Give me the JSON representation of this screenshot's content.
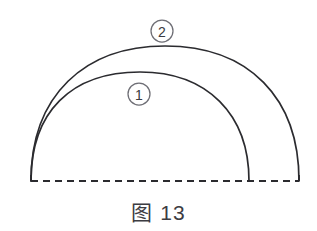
{
  "figure": {
    "caption_label": "图",
    "caption_number": "13",
    "background_color": "#ffffff",
    "stroke_color": "#2b2b2f",
    "label_outline_color": "#6e6e75"
  },
  "geometry": {
    "baseline": {
      "y": 181,
      "x_start": 31,
      "x_end": 299,
      "style": "dashed"
    },
    "arcs": [
      {
        "id": "arc-inner",
        "label": "①",
        "start_x": 31,
        "start_y": 181,
        "end_x": 249,
        "end_y": 181,
        "apex_x": 140,
        "apex_y": 72
      },
      {
        "id": "arc-outer",
        "label": "②",
        "start_x": 31,
        "start_y": 181,
        "end_x": 299,
        "end_y": 181,
        "apex_x": 165,
        "apex_y": 46
      }
    ],
    "labels": [
      {
        "id": "label-1",
        "text": "①",
        "digit": "1",
        "center_x": 139,
        "center_y": 94,
        "radius": 11
      },
      {
        "id": "label-2",
        "text": "②",
        "digit": "2",
        "center_x": 162,
        "center_y": 31,
        "radius": 11
      }
    ]
  }
}
